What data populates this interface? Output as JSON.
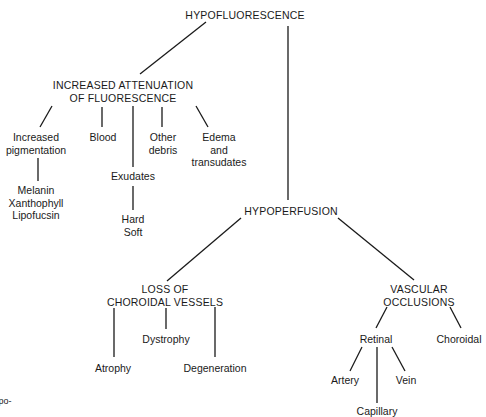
{
  "diagram": {
    "root": "HYPOFLUORESCENCE",
    "attenuation": {
      "title": "INCREASED ATTENUATION\nOF FLUORESCENCE",
      "children": {
        "pigmentation": "Increased\npigmentation",
        "pigments": "Melanin\nXanthophyll\nLipofucsin",
        "blood": "Blood",
        "exudates": "Exudates",
        "exudate_types": "Hard\nSoft",
        "other_debris": "Other\ndebris",
        "edema": "Edema\nand\ntransudates"
      }
    },
    "hypoperfusion": {
      "title": "HYPOPERFUSION",
      "loss": {
        "title": "LOSS OF\nCHOROIDAL VESSELS",
        "atrophy": "Atrophy",
        "dystrophy": "Dystrophy",
        "degeneration": "Degeneration"
      },
      "occlusions": {
        "title": "VASCULAR\nOCCLUSIONS",
        "retinal": "Retinal",
        "choroidal": "Choroidal",
        "artery": "Artery",
        "vein": "Vein",
        "capillary": "Capillary"
      }
    },
    "margin_fragment": "po-"
  }
}
